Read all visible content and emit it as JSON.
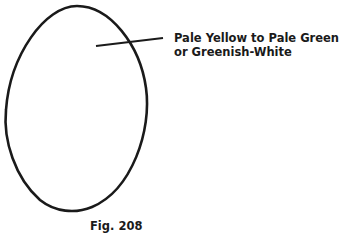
{
  "figure": {
    "label_line1": "Pale Yellow to Pale Green",
    "label_line2": "or Greenish-White",
    "caption": "Fig. 208",
    "stroke_color": "#1a1a1a"
  }
}
